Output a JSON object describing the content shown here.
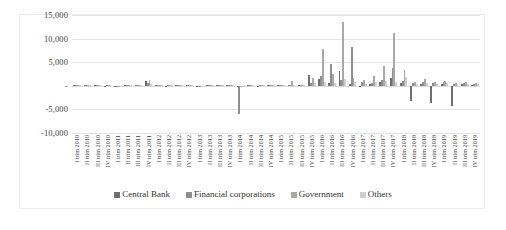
{
  "chart_data": {
    "type": "bar",
    "title": "",
    "xlabel": "",
    "ylabel": "",
    "ylim": [
      -10000,
      15000
    ],
    "yticks": [
      "15,000",
      "10,000",
      "5,000",
      "-",
      "-5,000",
      "-10,000"
    ],
    "ytick_values": [
      15000,
      10000,
      5000,
      0,
      -5000,
      -10000
    ],
    "grid": true,
    "legend_position": "bottom",
    "categories": [
      "I trim 2010",
      "II trim 2010",
      "III trim 2010",
      "IV trim 2010",
      "I trim 2011",
      "II trim 2011",
      "III trim 2011",
      "IV trim 2011",
      "I trim 2012",
      "II trim 2012",
      "III trim 2012",
      "IV trim 2012",
      "I trim 2013",
      "II trim 2013",
      "III trim 2013",
      "IV trim 2013",
      "I trim 2014",
      "II trim 2014",
      "III trim 2014",
      "IV trim 2014",
      "I trim 2015",
      "II trim 2015",
      "III trim 2015",
      "IV trim 2015",
      "I trim 2016",
      "II trim 2016",
      "III trim 2016",
      "IV trim 2016",
      "I trim 2017",
      "II trim 2017",
      "III trim 2017",
      "IV trim 2017",
      "I trim 2018",
      "II trim 2018",
      "III trim 2018",
      "IV trim 2018",
      "I trim 2019",
      "II trim 2019",
      "III trim 2019",
      "IV trim 2019"
    ],
    "series": [
      {
        "name": "Central Bank",
        "color": "#6f6f6f",
        "values": [
          120,
          90,
          150,
          60,
          -80,
          110,
          70,
          950,
          130,
          60,
          90,
          140,
          -60,
          80,
          110,
          70,
          -120,
          90,
          60,
          100,
          80,
          130,
          70,
          2300,
          1500,
          600,
          3100,
          400,
          -200,
          450,
          900,
          1700,
          600,
          -3300,
          350,
          -3600,
          400,
          -4300,
          300,
          250
        ]
      },
      {
        "name": "Financial corporations",
        "color": "#8f8f8f",
        "values": [
          200,
          180,
          260,
          150,
          -150,
          210,
          160,
          520,
          180,
          140,
          190,
          230,
          -140,
          170,
          200,
          160,
          -5900,
          180,
          150,
          210,
          190,
          240,
          170,
          500,
          2100,
          4600,
          1200,
          8300,
          700,
          600,
          1300,
          3700,
          1100,
          500,
          900,
          600,
          700,
          400,
          600,
          450
        ]
      },
      {
        "name": "Government",
        "color": "#a8a8a8",
        "values": [
          160,
          140,
          210,
          120,
          -110,
          170,
          130,
          1250,
          150,
          110,
          150,
          190,
          -100,
          130,
          160,
          130,
          -160,
          140,
          120,
          170,
          150,
          1100,
          140,
          1700,
          7800,
          2400,
          13500,
          1700,
          1200,
          2000,
          4200,
          11100,
          3400,
          700,
          1500,
          900,
          1000,
          500,
          800,
          550
        ]
      },
      {
        "name": "Others",
        "color": "#cfcfcf",
        "values": [
          100,
          80,
          130,
          70,
          -70,
          100,
          80,
          340,
          90,
          70,
          100,
          120,
          -60,
          80,
          100,
          80,
          -90,
          80,
          70,
          100,
          90,
          120,
          80,
          600,
          900,
          500,
          1500,
          700,
          400,
          900,
          1100,
          900,
          1900,
          300,
          600,
          400,
          500,
          300,
          400,
          300
        ]
      }
    ]
  },
  "legend": {
    "items": [
      {
        "label": "Central Bank",
        "swatch_name": "legend-swatch-central-bank"
      },
      {
        "label": "Financial corporations",
        "swatch_name": "legend-swatch-financial-corporations"
      },
      {
        "label": "Government",
        "swatch_name": "legend-swatch-government"
      },
      {
        "label": "Others",
        "swatch_name": "legend-swatch-others"
      }
    ]
  }
}
